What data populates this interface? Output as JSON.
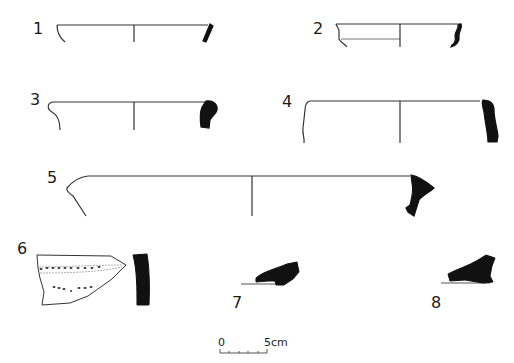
{
  "figure": {
    "type": "pottery-drawing-plate",
    "background": "#ffffff",
    "ink_color": "#111111",
    "line_color": "#333333",
    "items": [
      {
        "number": "1",
        "kind": "rim-profile"
      },
      {
        "number": "2",
        "kind": "rim-profile"
      },
      {
        "number": "3",
        "kind": "rim-profile"
      },
      {
        "number": "4",
        "kind": "rim-profile"
      },
      {
        "number": "5",
        "kind": "rim-profile"
      },
      {
        "number": "6",
        "kind": "decorated-body-sherd"
      },
      {
        "number": "7",
        "kind": "base-section"
      },
      {
        "number": "8",
        "kind": "base-section"
      }
    ]
  },
  "scale_bar": {
    "start_label": "0",
    "end_label": "5cm",
    "divisions": 5
  }
}
